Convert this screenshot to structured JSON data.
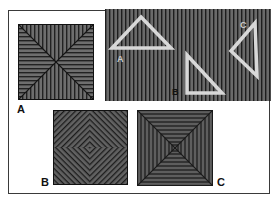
{
  "figure": {
    "colors": {
      "stripe_dark": "#222222",
      "stripe_light": "#6e6e6e",
      "triangle_outline": "#d8d8d8",
      "background": "#ffffff",
      "frame": "#3a3a3a"
    }
  },
  "panels": {
    "triangles": {
      "labels": [
        "A",
        "B",
        "C"
      ],
      "items": [
        {
          "label": "A",
          "shape": "triangle",
          "orientation": "apex-up"
        },
        {
          "label": "B",
          "shape": "triangle",
          "orientation": "right-angle-bottom-left"
        },
        {
          "label": "C",
          "shape": "triangle",
          "orientation": "apex-left"
        }
      ]
    },
    "squares": [
      {
        "label": "A",
        "pattern": "diagonal-x quadrants, horizontal/vertical stripes"
      },
      {
        "label": "B",
        "pattern": "pinwheel diagonal stripes"
      },
      {
        "label": "C",
        "pattern": "concentric square frames"
      }
    ]
  }
}
